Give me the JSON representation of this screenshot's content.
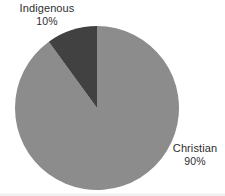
{
  "chart_data": {
    "type": "pie",
    "title": "",
    "categories": [
      "Christian",
      "Indigenous"
    ],
    "values": [
      90,
      10
    ],
    "value_labels": [
      "90%",
      "10%"
    ],
    "unit": "%",
    "start_angle_deg": 0,
    "direction": "clockwise",
    "legend": "none",
    "labels_position": "outside",
    "slices": [
      {
        "name": "Christian",
        "label": "Christian",
        "percent_label": "90%",
        "value": 90,
        "color": "#8c8c8c",
        "start_deg": 0,
        "end_deg": 324
      },
      {
        "name": "Indigenous",
        "label": "Indigenous",
        "percent_label": "10%",
        "value": 10,
        "color": "#414141",
        "start_deg": 324,
        "end_deg": 360
      }
    ],
    "geometry": {
      "center_x": 97,
      "center_y": 108,
      "radius": 82
    }
  },
  "colors": {
    "background": "#ffffff",
    "christian_slice": "#8c8c8c",
    "indigenous_slice": "#414141",
    "label_text": "#2e2e2e"
  },
  "labels": {
    "indigenous": {
      "name": "Indigenous",
      "percent": "10%"
    },
    "christian": {
      "name": "Christian",
      "percent": "90%"
    }
  }
}
